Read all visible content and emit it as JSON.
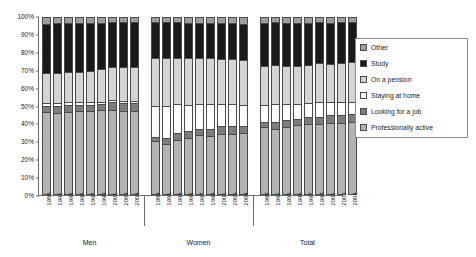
{
  "chart_data": {
    "type": "bar",
    "subtype": "stacked-100-percent",
    "title": "",
    "xlabel": "",
    "ylabel": "",
    "ylim": [
      0,
      100
    ],
    "ytick_labels": [
      "100%",
      "90%",
      "80%",
      "70%",
      "60%",
      "50%",
      "40%",
      "30%",
      "20%",
      "10%",
      "0%"
    ],
    "ytick_values": [
      100,
      90,
      80,
      70,
      60,
      50,
      40,
      30,
      20,
      10,
      0
    ],
    "grid": false,
    "legend_position": "right",
    "categories": [
      "1989",
      "1991",
      "1993",
      "1995",
      "1997",
      "1999",
      "2001",
      "2003",
      "2004"
    ],
    "groups": [
      "Men",
      "Women",
      "Total"
    ],
    "series": [
      {
        "name": "Professionally active",
        "color": "#b3b3b3",
        "values_by_group": {
          "Men": [
            46.5,
            46.0,
            46.5,
            47.0,
            47.0,
            47.5,
            47.5,
            47.0,
            47.0
          ],
          "Women": [
            30.0,
            28.5,
            30.5,
            32.0,
            33.5,
            33.0,
            34.0,
            34.0,
            34.5
          ],
          "Total": [
            38.0,
            37.0,
            38.0,
            39.0,
            40.0,
            40.0,
            40.5,
            40.5,
            41.0
          ]
        }
      },
      {
        "name": "Looking for a job",
        "color": "#7d7d7d",
        "values_by_group": {
          "Men": [
            3.5,
            4.0,
            4.0,
            3.5,
            3.5,
            3.5,
            4.5,
            4.5,
            4.5
          ],
          "Women": [
            2.5,
            3.5,
            4.0,
            3.5,
            3.5,
            4.0,
            4.5,
            4.5,
            4.0
          ],
          "Total": [
            3.0,
            4.0,
            4.0,
            3.5,
            3.5,
            4.0,
            4.5,
            4.5,
            4.5
          ]
        }
      },
      {
        "name": "Staying at home",
        "color": "#ffffff",
        "values_by_group": {
          "Men": [
            1.5,
            1.5,
            1.5,
            1.5,
            1.5,
            1.5,
            1.5,
            1.5,
            1.5
          ],
          "Women": [
            17.5,
            18.0,
            16.5,
            15.0,
            14.0,
            14.0,
            12.5,
            12.5,
            12.0
          ],
          "Total": [
            9.5,
            10.0,
            9.0,
            8.5,
            8.0,
            8.0,
            7.0,
            7.0,
            7.0
          ]
        }
      },
      {
        "name": "On a pension",
        "color": "#d4d4d4",
        "values_by_group": {
          "Men": [
            17.0,
            17.5,
            17.5,
            17.5,
            18.0,
            18.5,
            18.5,
            19.0,
            19.0
          ],
          "Women": [
            27.0,
            27.0,
            26.5,
            26.5,
            26.0,
            26.0,
            25.5,
            25.5,
            25.5
          ],
          "Total": [
            22.0,
            22.5,
            22.0,
            22.0,
            22.0,
            22.5,
            22.0,
            22.5,
            22.5
          ]
        }
      },
      {
        "name": "Study",
        "color": "#1a1a1a",
        "values_by_group": {
          "Men": [
            28.0,
            28.0,
            27.5,
            27.5,
            27.0,
            26.0,
            25.5,
            25.5,
            25.5
          ],
          "Women": [
            20.5,
            20.5,
            20.0,
            20.0,
            20.0,
            20.0,
            20.5,
            20.5,
            20.5
          ],
          "Total": [
            24.5,
            24.0,
            24.0,
            24.0,
            23.5,
            23.0,
            23.0,
            23.0,
            22.5
          ]
        }
      },
      {
        "name": "Other",
        "color": "#9e9e9e",
        "values_by_group": {
          "Men": [
            3.5,
            3.0,
            3.0,
            3.0,
            3.0,
            3.0,
            2.5,
            2.5,
            2.5
          ],
          "Women": [
            2.5,
            2.5,
            2.5,
            3.0,
            3.0,
            3.0,
            3.0,
            3.0,
            3.5
          ],
          "Total": [
            3.0,
            2.5,
            3.0,
            3.0,
            3.0,
            2.5,
            3.0,
            2.5,
            2.5
          ]
        }
      }
    ],
    "legend": [
      {
        "label": "Other",
        "color": "#9e9e9e"
      },
      {
        "label": "Study",
        "color": "#1a1a1a"
      },
      {
        "label": "On a pension",
        "color": "#d4d4d4"
      },
      {
        "label": "Staying at home",
        "color": "#ffffff"
      },
      {
        "label": "Looking for a job",
        "color": "#7d7d7d"
      },
      {
        "label": "Professionally active",
        "color": "#b3b3b3"
      }
    ]
  }
}
